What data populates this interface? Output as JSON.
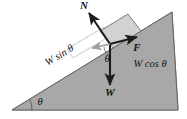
{
  "figure": {
    "background_color": "#ffffff",
    "incline": {
      "name": "inclined-plane",
      "fill_color": "#a8a8a8",
      "stroke_color": "#5a5a5a",
      "apex_angle_label": "θ"
    },
    "block": {
      "name": "block-on-incline",
      "fill_color": "#d2d2d2",
      "stroke_color": "#6e6e6e"
    },
    "component_box": {
      "name": "component-rectangle",
      "stroke_color": "#b5b5b5"
    }
  },
  "vectors": [
    {
      "id": "normal-force",
      "label": "N",
      "description": "normal force, perpendicular to incline surface",
      "color": "#1c1c1c",
      "style": "bold-italic"
    },
    {
      "id": "friction-force",
      "label": "F",
      "description": "friction force, up the incline",
      "color": "#1c1c1c",
      "style": "bold-italic"
    },
    {
      "id": "weight-force",
      "label": "W",
      "description": "weight, straight down",
      "color": "#1c1c1c",
      "style": "bold-italic"
    }
  ],
  "components": [
    {
      "id": "weight-parallel",
      "label": "W sin θ",
      "description": "component of weight parallel to incline",
      "color": "#1c1c1c",
      "style": "italic"
    },
    {
      "id": "weight-perpendicular",
      "label": "W cos θ",
      "description": "component of weight perpendicular to incline",
      "color": "#1c1c1c",
      "style": "italic"
    }
  ],
  "angles": [
    {
      "id": "incline-base-angle",
      "label": "θ",
      "description": "angle of incline at base"
    },
    {
      "id": "weight-angle",
      "label": "θ",
      "description": "angle between weight vector and perpendicular component"
    }
  ]
}
